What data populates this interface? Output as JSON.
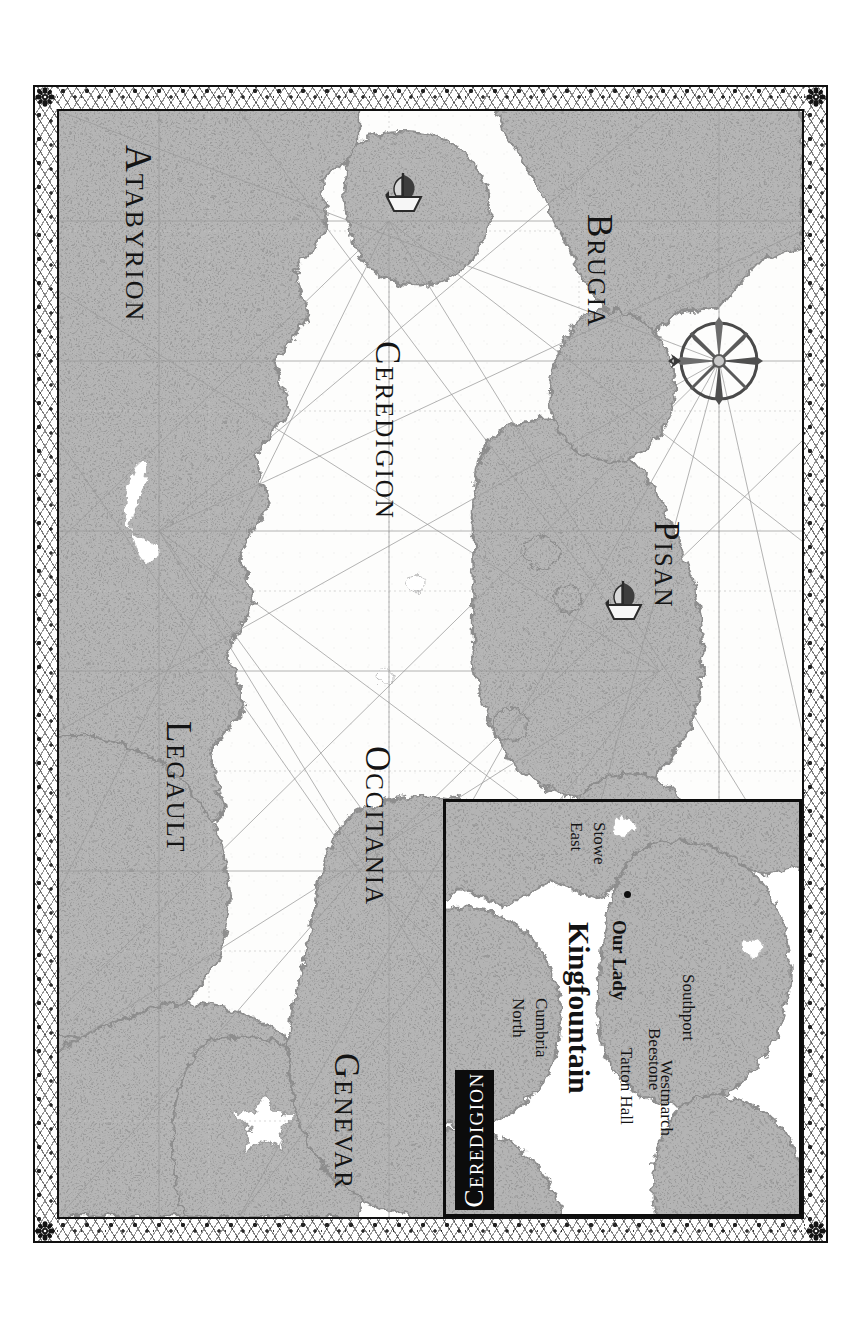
{
  "map": {
    "title": "Ceredigion and Surrounding Kingdoms",
    "style": "portolan-chart",
    "orientation_note": "labels rotated 90 degrees clockwise",
    "sea_color": "#fdfdfc",
    "land_color": "#b2b2b2",
    "ink_color": "#141414",
    "frame_color": "#101010"
  },
  "regions": [
    {
      "id": "atabyrion",
      "label": "Atabyrion"
    },
    {
      "id": "ceredigion",
      "label": "Ceredigion"
    },
    {
      "id": "brugia",
      "label": "Brugia"
    },
    {
      "id": "pisan",
      "label": "Pisan"
    },
    {
      "id": "occitania",
      "label": "Occitania"
    },
    {
      "id": "legault",
      "label": "Legault"
    },
    {
      "id": "genevar",
      "label": "Genevar"
    }
  ],
  "compass": {
    "name": "compass-rose",
    "points": 8,
    "north_indicator": "fleur-arrow"
  },
  "ships": [
    {
      "id": "ship-north",
      "name": "sailing-ship"
    },
    {
      "id": "ship-south",
      "name": "sailing-ship"
    }
  ],
  "inset": {
    "title": "Ceredigion",
    "places": [
      {
        "id": "north-cumbria",
        "label": "North\nCumbria",
        "line1": "North",
        "line2": "Cumbria"
      },
      {
        "id": "east-stowe",
        "label": "East\nStowe",
        "line1": "East",
        "line2": "Stowe"
      },
      {
        "id": "kingfountain",
        "label": "Kingfountain"
      },
      {
        "id": "our-lady",
        "label": "Our Lady"
      },
      {
        "id": "tatton-hall",
        "label": "Tatton Hall"
      },
      {
        "id": "westmarch",
        "label": "Westmarch"
      },
      {
        "id": "beestone",
        "label": "Beestone"
      },
      {
        "id": "southport",
        "label": "Southport"
      }
    ]
  }
}
